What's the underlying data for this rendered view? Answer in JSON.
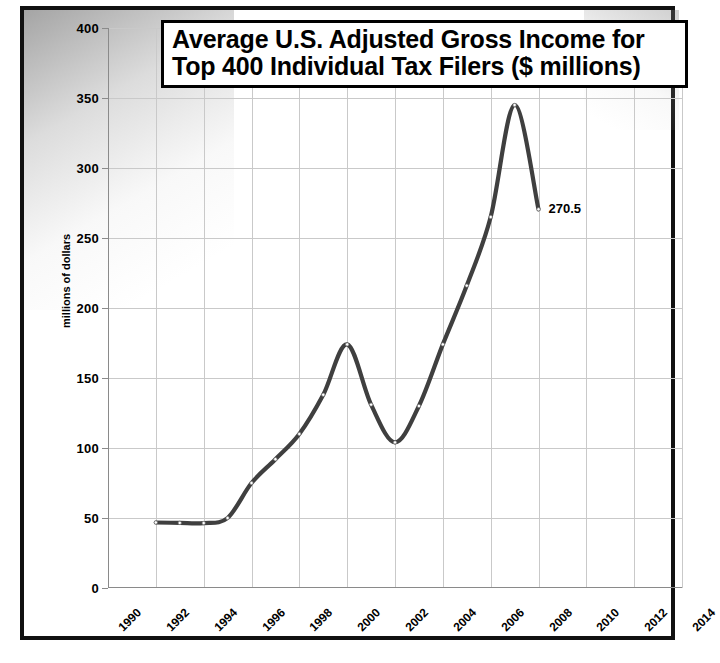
{
  "chart_data": {
    "type": "line",
    "title": "Average U.S. Adjusted Gross Income for Top 400 Individual Tax Filers ($ millions)",
    "title_lines": [
      "Average U.S. Adjusted Gross Income for",
      "Top 400 Individual Tax Filers ($ millions)"
    ],
    "xlabel": "",
    "ylabel": "millions of dollars",
    "xlim": [
      1990,
      2014
    ],
    "ylim": [
      0,
      400
    ],
    "ytick_step": 50,
    "xtick_step": 2,
    "grid": true,
    "legend": false,
    "line_color": "#3f3f3f",
    "marker_color": "#ffffff",
    "yticks": [
      "0",
      "50",
      "100",
      "150",
      "200",
      "250",
      "300",
      "350",
      "400"
    ],
    "ytick_values": [
      0,
      50,
      100,
      150,
      200,
      250,
      300,
      350,
      400
    ],
    "xticks": [
      "1990",
      "1992",
      "1994",
      "1996",
      "1998",
      "2000",
      "2002",
      "2004",
      "2006",
      "2008",
      "2010",
      "2012",
      "2014"
    ],
    "xtick_values": [
      1990,
      1992,
      1994,
      1996,
      1998,
      2000,
      2002,
      2004,
      2006,
      2008,
      2010,
      2012,
      2014
    ],
    "x": [
      1992,
      1993,
      1994,
      1995,
      1996,
      1997,
      1998,
      1999,
      2000,
      2001,
      2002,
      2003,
      2004,
      2005,
      2006,
      2007,
      2008
    ],
    "values": [
      46.8,
      46.5,
      46.4,
      50.0,
      75.0,
      92.0,
      110.0,
      138.0,
      174.0,
      131.0,
      104.0,
      130.0,
      174.0,
      216.0,
      265.0,
      345.0,
      270.5
    ],
    "series": [
      {
        "name": "Average AGI of top 400 filers",
        "values": [
          46.8,
          46.5,
          46.4,
          50.0,
          75.0,
          92.0,
          110.0,
          138.0,
          174.0,
          131.0,
          104.0,
          130.0,
          174.0,
          216.0,
          265.0,
          345.0,
          270.5
        ]
      }
    ],
    "annotations": [
      {
        "text": "270.5",
        "x": 2008,
        "y": 270.5
      }
    ]
  }
}
